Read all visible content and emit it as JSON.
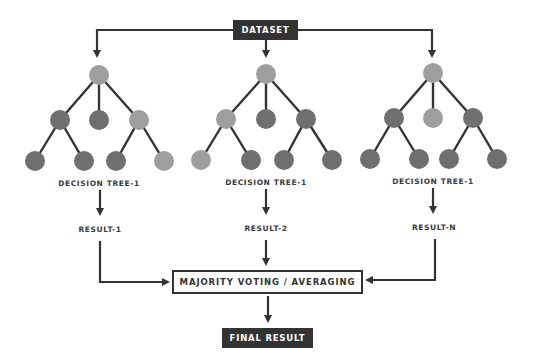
{
  "dataset": {
    "label": "DATASET"
  },
  "trees": [
    {
      "name": "DECISION TREE-1",
      "result": "RESULT-1",
      "root": "light",
      "level2": [
        "dark",
        "dark",
        "light"
      ],
      "level3": [
        "dark",
        "dark",
        "dark",
        "light"
      ]
    },
    {
      "name": "DECISION TREE-1",
      "result": "RESULT-2",
      "root": "light",
      "level2": [
        "light",
        "dark",
        "dark"
      ],
      "level3": [
        "light",
        "dark",
        "dark",
        "dark"
      ]
    },
    {
      "name": "DECISION TREE-1",
      "result": "RESULT-N",
      "root": "light",
      "level2": [
        "dark",
        "light",
        "dark"
      ],
      "level3": [
        "dark",
        "dark",
        "dark",
        "dark"
      ]
    }
  ],
  "aggregation": {
    "label": "MAJORITY VOTING / AVERAGING"
  },
  "final": {
    "label": "FINAL RESULT"
  },
  "colors": {
    "node_light": "#9e9e9e",
    "node_dark": "#6f6f6f",
    "line": "#333333",
    "box_dark": "#333333"
  }
}
